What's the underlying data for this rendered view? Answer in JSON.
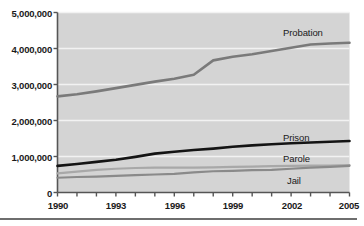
{
  "chart_data": {
    "type": "line",
    "title": "",
    "subtitle": "",
    "xlabel": "",
    "ylabel": "",
    "xlim": [
      1990,
      2005
    ],
    "ylim": [
      0,
      5000000
    ],
    "grid": true,
    "grid_axis": "y",
    "legend_position": "inline-right",
    "plot_background": "#d4d4d4",
    "gridline_color": "#f2f2f2",
    "axis_color": "#555555",
    "x": [
      1990,
      1991,
      1992,
      1993,
      1994,
      1995,
      1996,
      1997,
      1998,
      1999,
      2000,
      2001,
      2002,
      2003,
      2004,
      2005
    ],
    "y_ticks": [
      0,
      1000000,
      2000000,
      3000000,
      4000000,
      5000000
    ],
    "y_tick_labels": [
      "0",
      "1,000,000",
      "2,000,000",
      "3,000,000",
      "4,000,000",
      "5,000,000"
    ],
    "x_ticks": [
      1990,
      1991,
      1992,
      1993,
      1994,
      1995,
      1996,
      1997,
      1998,
      1999,
      2000,
      2001,
      2002,
      2003,
      2004,
      2005
    ],
    "x_tick_labels_shown": [
      "1990",
      "1993",
      "1996",
      "1999",
      "2002",
      "2005"
    ],
    "x_labeled_ticks": [
      1990,
      1993,
      1996,
      1999,
      2002,
      2005
    ],
    "series": [
      {
        "name": "Probation",
        "label": "Probation",
        "color": "#7a7a7a",
        "width": 2.6,
        "values": [
          2670000,
          2730000,
          2810000,
          2900000,
          2990000,
          3080000,
          3160000,
          3270000,
          3670000,
          3770000,
          3840000,
          3930000,
          4020000,
          4110000,
          4140000,
          4160000
        ]
      },
      {
        "name": "Prison",
        "label": "Prison",
        "color": "#141414",
        "width": 2.6,
        "values": [
          740000,
          790000,
          850000,
          910000,
          990000,
          1080000,
          1130000,
          1180000,
          1220000,
          1270000,
          1310000,
          1340000,
          1370000,
          1390000,
          1410000,
          1430000
        ]
      },
      {
        "name": "Parole",
        "label": "Parole",
        "color": "#a8a8a8",
        "width": 2.2,
        "values": [
          530000,
          580000,
          630000,
          660000,
          680000,
          690000,
          690000,
          690000,
          700000,
          710000,
          720000,
          730000,
          740000,
          745000,
          750000,
          760000
        ]
      },
      {
        "name": "Jail",
        "label": "Jail",
        "color": "#8a8a8a",
        "width": 2.2,
        "values": [
          410000,
          430000,
          440000,
          460000,
          480000,
          500000,
          515000,
          560000,
          590000,
          600000,
          620000,
          630000,
          660000,
          690000,
          710000,
          740000
        ]
      }
    ],
    "annotations": [
      {
        "text": "Probation",
        "series": "Probation"
      },
      {
        "text": "Prison",
        "series": "Prison"
      },
      {
        "text": "Parole",
        "series": "Parole"
      },
      {
        "text": "Jail",
        "series": "Jail"
      }
    ]
  },
  "labels": {
    "y0": "0",
    "y1": "1,000,000",
    "y2": "2,000,000",
    "y3": "3,000,000",
    "y4": "4,000,000",
    "y5": "5,000,000",
    "x0": "1990",
    "x1": "1993",
    "x2": "1996",
    "x3": "1999",
    "x4": "2002",
    "x5": "2005",
    "probation": "Probation",
    "prison": "Prison",
    "parole": "Parole",
    "jail": "Jail"
  }
}
